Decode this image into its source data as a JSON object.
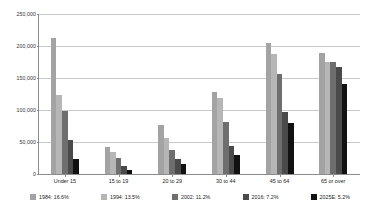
{
  "chart_data": {
    "type": "bar",
    "title": "",
    "subtitle": "",
    "xlabel": "",
    "ylabel": "",
    "ylim": [
      0,
      250000
    ],
    "ytick_values": [
      250000,
      200000,
      150000,
      100000,
      50000,
      0
    ],
    "ytick_labels": [
      "250,000",
      "200,000",
      "150,000",
      "100,000",
      "50,000",
      "0"
    ],
    "grid": true,
    "legend_position": "bottom",
    "categories": [
      "Under 15",
      "15 to 19",
      "20 to 29",
      "30 to 44",
      "45 to 64",
      "65 or over"
    ],
    "series": [
      {
        "name": "1984: 16.6%",
        "year": "1984",
        "share": "16.6%",
        "color": "#a3a3a3",
        "values": [
          212000,
          42000,
          77000,
          128000,
          205000,
          189000
        ]
      },
      {
        "name": "1994: 13.5%",
        "year": "1994",
        "share": "13.5%",
        "color": "#b6b6b6",
        "values": [
          124000,
          35000,
          56000,
          118000,
          188000,
          175000
        ]
      },
      {
        "name": "2002: 11.2%",
        "year": "2002",
        "share": "11.2%",
        "color": "#6e6e6e",
        "values": [
          99000,
          25000,
          38000,
          81000,
          157000,
          175000
        ]
      },
      {
        "name": "2016: 7.2%",
        "year": "2016",
        "share": "7.2%",
        "color": "#4a4a4a",
        "values": [
          53000,
          13000,
          23000,
          44000,
          97000,
          167000
        ]
      },
      {
        "name": "2025E: 5.2%",
        "year": "2025E",
        "share": "5.2%",
        "color": "#111111",
        "values": [
          24000,
          7000,
          15000,
          30000,
          80000,
          141000
        ]
      }
    ]
  }
}
